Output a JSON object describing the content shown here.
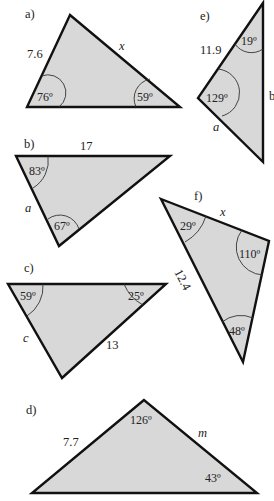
{
  "diagram": {
    "colors": {
      "fill": "#d8d8d8",
      "stroke": "#111111",
      "background": "#ffffff"
    },
    "triangles": [
      {
        "id": "a",
        "label": "a)",
        "sides": {
          "left": "7.6",
          "right": "x"
        },
        "angles": {
          "bottom_left": "76º",
          "bottom_right": "59º"
        }
      },
      {
        "id": "b",
        "label": "b)",
        "sides": {
          "top": "17",
          "left": "a"
        },
        "angles": {
          "top_left": "83º",
          "bottom": "67º"
        }
      },
      {
        "id": "c",
        "label": "c)",
        "sides": {
          "left": "c",
          "right": "13"
        },
        "angles": {
          "top_left": "59º",
          "top_right": "25º"
        }
      },
      {
        "id": "d",
        "label": "d)",
        "sides": {
          "left": "7.7",
          "right": "m"
        },
        "angles": {
          "top": "126º",
          "bottom_right": "43º"
        }
      },
      {
        "id": "e",
        "label": "e)",
        "sides": {
          "upper_left": "11.9",
          "lower_left": "a",
          "right": "b"
        },
        "angles": {
          "top": "19º",
          "left": "129º"
        }
      },
      {
        "id": "f",
        "label": "f)",
        "sides": {
          "top": "x",
          "left": "12.4"
        },
        "angles": {
          "top_left": "29º",
          "right": "110º",
          "bottom": "48º"
        }
      }
    ]
  }
}
